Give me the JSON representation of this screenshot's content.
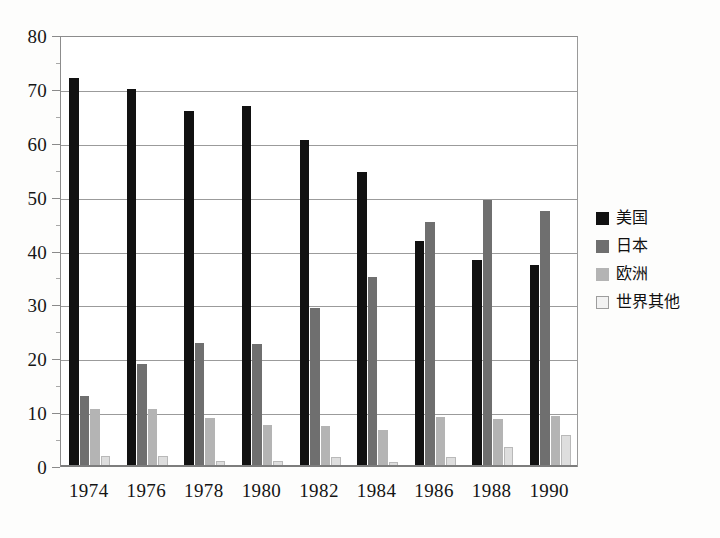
{
  "chart_data": {
    "type": "bar",
    "title": "",
    "subtitle": "",
    "xlabel": "",
    "ylabel": "",
    "ylim": [
      0,
      80
    ],
    "ytick_step": 10,
    "ytick_minor_step": 5,
    "grid": true,
    "legend_position": "right",
    "categories": [
      "1974",
      "1976",
      "1978",
      "1980",
      "1982",
      "1984",
      "1986",
      "1988",
      "1990"
    ],
    "ytick_labels": [
      "0",
      "10",
      "20",
      "30",
      "40",
      "50",
      "60",
      "70",
      "80"
    ],
    "series": [
      {
        "name": "美国",
        "color": "#111111",
        "values": [
          72.0,
          70.0,
          65.9,
          66.8,
          60.5,
          54.6,
          41.7,
          38.3,
          37.3
        ]
      },
      {
        "name": "日本",
        "color": "#6f6f6f",
        "values": [
          13.0,
          18.9,
          22.8,
          22.7,
          29.4,
          35.1,
          45.3,
          49.3,
          47.3
        ]
      },
      {
        "name": "欧洲",
        "color": "#b4b4b4",
        "values": [
          10.6,
          10.6,
          9.0,
          7.6,
          7.4,
          6.7,
          9.1,
          8.7,
          9.2
        ]
      },
      {
        "name": "世界其他",
        "color": "#dedede",
        "values": [
          1.8,
          1.8,
          1.0,
          0.9,
          1.6,
          0.8,
          1.7,
          3.6,
          5.7
        ]
      }
    ]
  },
  "legend": {
    "items": [
      {
        "label": "美国",
        "swatch": "legend-swatch-black"
      },
      {
        "label": "日本",
        "swatch": "legend-swatch-dark-gray"
      },
      {
        "label": "欧洲",
        "swatch": "legend-swatch-light-gray"
      },
      {
        "label": "世界其他",
        "swatch": "legend-swatch-white"
      }
    ]
  }
}
